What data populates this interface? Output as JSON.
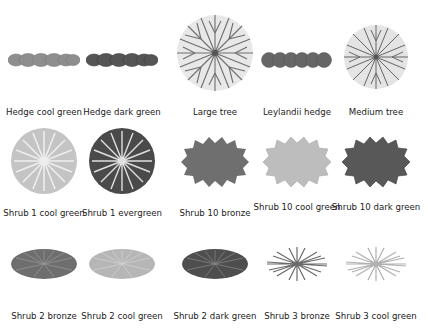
{
  "rows": [
    {
      "items": [
        {
          "label": "Hedge cool green",
          "icon": "hedge-cool-green-icon",
          "tone": "#8e8e8e"
        },
        {
          "label": "Hedge dark green",
          "icon": "hedge-dark-green-icon",
          "tone": "#555555"
        },
        {
          "label": "Large tree",
          "icon": "large-tree-icon",
          "tone": "#6e6e6e"
        },
        {
          "label": "Leylandii hedge",
          "icon": "leylandii-hedge-icon",
          "tone": "#666666"
        },
        {
          "label": "Medium tree",
          "icon": "medium-tree-icon",
          "tone": "#6a6a6a"
        }
      ]
    },
    {
      "items": [
        {
          "label": "Shrub 1 cool green",
          "icon": "shrub-1-cool-green-icon",
          "tone": "#b4b4b4"
        },
        {
          "label": "Shrub 1 evergreen",
          "icon": "shrub-1-evergreen-icon",
          "tone": "#4a4a4a"
        },
        {
          "label": "Shrub 10 bronze",
          "icon": "shrub-10-bronze-icon",
          "tone": "#6f6f6f"
        },
        {
          "label": "Shrub 10 cool green",
          "icon": "shrub-10-cool-green-icon",
          "tone": "#bdbdbd"
        },
        {
          "label": "Shrub 10 dark green",
          "icon": "shrub-10-dark-green-icon",
          "tone": "#585858"
        }
      ]
    },
    {
      "items": [
        {
          "label": "Shrub 2 bronze",
          "icon": "shrub-2-bronze-icon",
          "tone": "#6e6e6e"
        },
        {
          "label": "Shrub 2 cool green",
          "icon": "shrub-2-cool-green-icon",
          "tone": "#b6b6b6"
        },
        {
          "label": "Shrub 2 dark green",
          "icon": "shrub-2-dark-green-icon",
          "tone": "#4e4e4e"
        },
        {
          "label": "Shrub 3 bronze",
          "icon": "shrub-3-bronze-icon",
          "tone": "#6a6a6a"
        },
        {
          "label": "Shrub 3 cool green",
          "icon": "shrub-3-cool-green-icon",
          "tone": "#b0b0b0"
        }
      ]
    }
  ]
}
